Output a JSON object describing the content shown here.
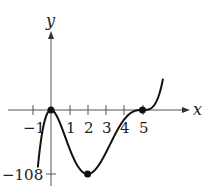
{
  "chart_data": {
    "type": "line",
    "title": "",
    "xlabel": "x",
    "ylabel": "y",
    "function": "x^2 (x-5)^3",
    "x_ticks": [
      -1,
      1,
      2,
      3,
      4,
      5
    ],
    "x_tick_labels": [
      "−1",
      "1",
      "2",
      "3",
      "4",
      "5"
    ],
    "y_ticks": [
      -108
    ],
    "y_tick_labels": [
      "−108"
    ],
    "xlim": [
      -2.4,
      6.8
    ],
    "ylim": [
      -118,
      140
    ],
    "highlighted_points": [
      {
        "x": 0,
        "y": 0
      },
      {
        "x": 2,
        "y": -108
      },
      {
        "x": 5,
        "y": 0
      }
    ],
    "series": [
      {
        "name": "f(x)",
        "x": [
          -0.7,
          -0.5,
          -0.25,
          0,
          0.5,
          1,
          1.5,
          2,
          2.5,
          3,
          3.5,
          4,
          4.5,
          5,
          5.5,
          5.9,
          6.1
        ],
        "y": [
          -91.0,
          -41.6,
          -8.6,
          0,
          -22.8,
          -64,
          -96.5,
          -108,
          -97.7,
          -72,
          -41.3,
          -16,
          -2.5,
          0,
          3.8,
          25.5,
          47.4
        ]
      }
    ],
    "grid": false,
    "legend": null
  },
  "labels": {
    "x_axis": "x",
    "y_axis": "y",
    "y_value": "−108",
    "ticks": [
      "−1",
      "1",
      "2",
      "3",
      "4",
      "5"
    ]
  }
}
